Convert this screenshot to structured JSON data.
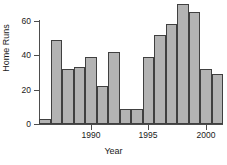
{
  "chart_data": {
    "type": "bar",
    "title": "",
    "xlabel": "Year",
    "ylabel": "Home Runs",
    "categories": [
      "1986",
      "1987",
      "1988",
      "1989",
      "1990",
      "1991",
      "1992",
      "1993",
      "1994",
      "1995",
      "1996",
      "1997",
      "1998",
      "1999",
      "2000",
      "2001"
    ],
    "values": [
      3,
      49,
      32,
      33,
      39,
      22,
      42,
      9,
      9,
      39,
      52,
      58,
      70,
      65,
      32,
      29
    ],
    "x": [
      1986,
      1987,
      1988,
      1989,
      1990,
      1991,
      1992,
      1993,
      1994,
      1995,
      1996,
      1997,
      1998,
      1999,
      2000,
      2001
    ],
    "xlim": [
      1985.5,
      2001.5
    ],
    "ylim": [
      0,
      73
    ],
    "y_ticks": [
      0,
      20,
      40,
      60
    ],
    "y_tick_labels": [
      "0",
      "20",
      "40",
      "60"
    ],
    "x_ticks": [
      1990,
      1995,
      2000
    ],
    "x_tick_labels": [
      "1990",
      "1995",
      "2000"
    ],
    "grid": false,
    "legend": false,
    "legend_position": "none",
    "bar_fill_color": "#b3b3b3",
    "bar_edge_color": "#404040",
    "axis_color": "#4d4d4d",
    "text_color": "#1a1a1a",
    "background_color": "#ffffff"
  }
}
